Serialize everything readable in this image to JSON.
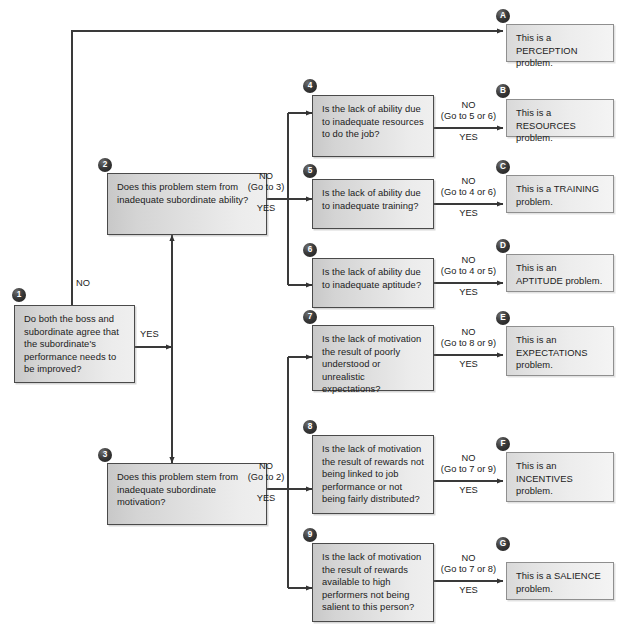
{
  "diagram": {
    "colors": {
      "box_border": "#4a4a4a",
      "answer_border": "#8f8f8f",
      "badge_fill": "#1d1d1d",
      "line": "#3a3a3a",
      "text": "#1b1b1b"
    }
  },
  "questions": [
    {
      "badge": "1",
      "text": "Do both the boss and subordinate agree that the subordinate's performance needs to be improved?",
      "no_label": "NO",
      "no_goto": "",
      "yes_label": "YES"
    },
    {
      "badge": "2",
      "text": "Does this problem stem from inadequate subordinate ability?",
      "no_label": "NO",
      "no_goto": "(Go to 3)",
      "yes_label": "YES"
    },
    {
      "badge": "3",
      "text": "Does this problem stem from inadequate subordinate motivation?",
      "no_label": "NO",
      "no_goto": "(Go to 2)",
      "yes_label": "YES"
    },
    {
      "badge": "4",
      "text": "Is the lack of ability due to inadequate resources to do the job?",
      "no_label": "NO",
      "no_goto": "(Go to 5 or 6)",
      "yes_label": "YES"
    },
    {
      "badge": "5",
      "text": "Is the lack of ability due to inadequate training?",
      "no_label": "NO",
      "no_goto": "(Go to 4 or 6)",
      "yes_label": "YES"
    },
    {
      "badge": "6",
      "text": "Is the lack of ability due to inadequate aptitude?",
      "no_label": "NO",
      "no_goto": "(Go to 4 or 5)",
      "yes_label": "YES"
    },
    {
      "badge": "7",
      "text": "Is the lack of motivation the result of poorly understood or unrealistic expectations?",
      "no_label": "NO",
      "no_goto": "(Go to 8 or 9)",
      "yes_label": "YES"
    },
    {
      "badge": "8",
      "text": "Is the lack of motivation the result of rewards not being linked to job performance or not being fairly distributed?",
      "no_label": "NO",
      "no_goto": "(Go to 7 or 9)",
      "yes_label": "YES"
    },
    {
      "badge": "9",
      "text": "Is the lack of motivation the result of rewards available to high performers not being salient to this person?",
      "no_label": "NO",
      "no_goto": "(Go to 7 or 8)",
      "yes_label": "YES"
    }
  ],
  "answers": [
    {
      "badge": "A",
      "text": "This is a PERCEPTION problem."
    },
    {
      "badge": "B",
      "text": "This is a RESOURCES problem."
    },
    {
      "badge": "C",
      "text": "This is a TRAINING problem."
    },
    {
      "badge": "D",
      "text": "This is an APTITUDE problem."
    },
    {
      "badge": "E",
      "text": "This is an EXPECTATIONS problem."
    },
    {
      "badge": "F",
      "text": "This is an INCENTIVES problem."
    },
    {
      "badge": "G",
      "text": "This is a SALIENCE problem."
    }
  ]
}
